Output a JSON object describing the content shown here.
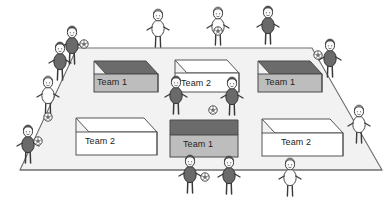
{
  "scene": {
    "title": "Classroom team activity illustration",
    "description": "A trapezoidal room floor seen in perspective containing six open boxes labelled by team, surrounded by stick figures holding balls.",
    "background_color": "#ffffff",
    "floor_color": "#f2f2f2",
    "floor_outline_color": "#6e6e6e"
  },
  "boxes": [
    {
      "id": "box-top-left",
      "label": "Team 1",
      "team": 1,
      "style": "shaded",
      "front_color": "#bdbdbd",
      "top_color": "#6b6b6b",
      "outline_color": "#4a4a4a",
      "label_x": 97,
      "label_y": 83
    },
    {
      "id": "box-top-center",
      "label": "Team 2",
      "team": 2,
      "style": "plain",
      "front_color": "#ffffff",
      "top_color": "#ffffff",
      "outline_color": "#555555",
      "label_x": 181,
      "label_y": 84
    },
    {
      "id": "box-top-right",
      "label": "Team 1",
      "team": 1,
      "style": "shaded",
      "front_color": "#bdbdbd",
      "top_color": "#6b6b6b",
      "outline_color": "#4a4a4a",
      "label_x": 265,
      "label_y": 84
    },
    {
      "id": "box-bottom-left",
      "label": "Team 2",
      "team": 2,
      "style": "plain",
      "front_color": "#ffffff",
      "top_color": "#ffffff",
      "outline_color": "#555555",
      "label_x": 85,
      "label_y": 142
    },
    {
      "id": "box-bottom-center",
      "label": "Team 1",
      "team": 1,
      "style": "shaded",
      "front_color": "#bdbdbd",
      "top_color": "#6b6b6b",
      "outline_color": "#4a4a4a",
      "label_x": 183,
      "label_y": 145
    },
    {
      "id": "box-bottom-right",
      "label": "Team 2",
      "team": 2,
      "style": "plain",
      "front_color": "#ffffff",
      "top_color": "#ffffff",
      "outline_color": "#555555",
      "label_x": 281,
      "label_y": 146
    }
  ],
  "figures": [
    {
      "id": "figure-left-outer-upper",
      "shade": "dark",
      "holds_ball": true,
      "position": "outside-left-upper"
    },
    {
      "id": "figure-left-outer-mid",
      "shade": "dark",
      "holds_ball": false,
      "position": "outside-left-upper"
    },
    {
      "id": "figure-left-outer-lower",
      "shade": "light",
      "holds_ball": false,
      "position": "outside-left"
    },
    {
      "id": "figure-left-outer-bottom",
      "shade": "dark",
      "holds_ball": true,
      "position": "outside-left-lower"
    },
    {
      "id": "figure-top-left",
      "shade": "light",
      "holds_ball": false,
      "position": "outside-top"
    },
    {
      "id": "figure-top-center",
      "shade": "light",
      "holds_ball": true,
      "position": "outside-top"
    },
    {
      "id": "figure-top-right",
      "shade": "dark",
      "holds_ball": false,
      "position": "outside-top"
    },
    {
      "id": "figure-right-outer-upper",
      "shade": "dark",
      "holds_ball": true,
      "position": "outside-right-upper"
    },
    {
      "id": "figure-right-outer-lower",
      "shade": "light",
      "holds_ball": false,
      "position": "outside-right-lower"
    },
    {
      "id": "figure-field-center-left",
      "shade": "dark",
      "holds_ball": false,
      "position": "on-field-center"
    },
    {
      "id": "figure-field-center-right",
      "shade": "dark",
      "holds_ball": false,
      "position": "on-field-center"
    },
    {
      "id": "figure-bottom-left",
      "shade": "dark",
      "holds_ball": true,
      "position": "bottom-edge"
    },
    {
      "id": "figure-bottom-center",
      "shade": "dark",
      "holds_ball": false,
      "position": "bottom-edge"
    },
    {
      "id": "figure-bottom-right",
      "shade": "light",
      "holds_ball": false,
      "position": "bottom-edge"
    }
  ],
  "balls": [
    {
      "id": "ball-field-center",
      "x": 212,
      "y": 110
    },
    {
      "id": "ball-left-lower",
      "x": 35,
      "y": 125
    },
    {
      "id": "ball-left-upper",
      "x": 82,
      "y": 44
    },
    {
      "id": "ball-right-upper",
      "x": 322,
      "y": 54
    },
    {
      "id": "ball-top-center",
      "x": 218,
      "y": 30
    },
    {
      "id": "ball-bottom-left",
      "x": 204,
      "y": 188
    },
    {
      "id": "ball-left-feet",
      "x": 47,
      "y": 118
    }
  ],
  "palette": {
    "dark_body": "#6a6a6a",
    "dark_body_stroke": "#333333",
    "light_body": "#fdfdfd",
    "light_body_stroke": "#4a4a4a",
    "hair": "#555555",
    "line": "#3a3a3a"
  }
}
